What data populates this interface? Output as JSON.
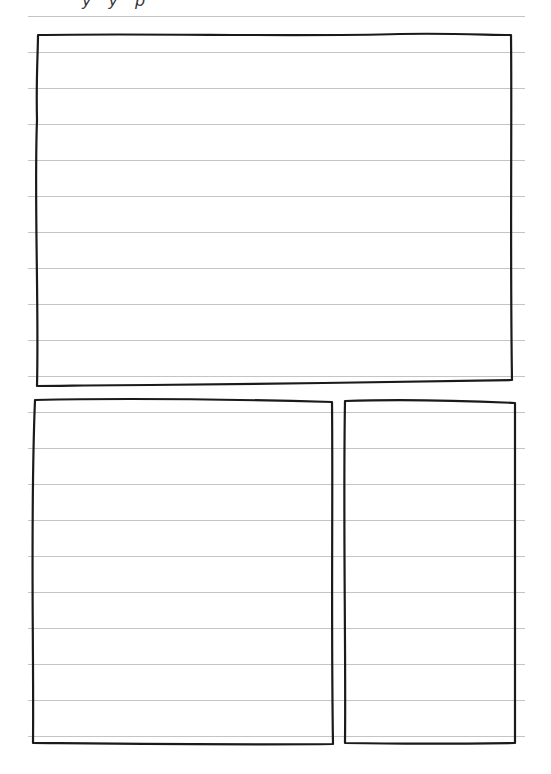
{
  "page": {
    "type": "lined-notebook-storyboard",
    "clipped_header_text": "y y p",
    "rule_color": "#c4c4c4",
    "ink_color": "#1a1a1a",
    "rule_spacing_px": 36
  },
  "panels": [
    {
      "id": "panel-top",
      "label": "",
      "position": "top-wide"
    },
    {
      "id": "panel-bottom-left",
      "label": "",
      "position": "bottom-left"
    },
    {
      "id": "panel-bottom-right",
      "label": "",
      "position": "bottom-right"
    }
  ]
}
